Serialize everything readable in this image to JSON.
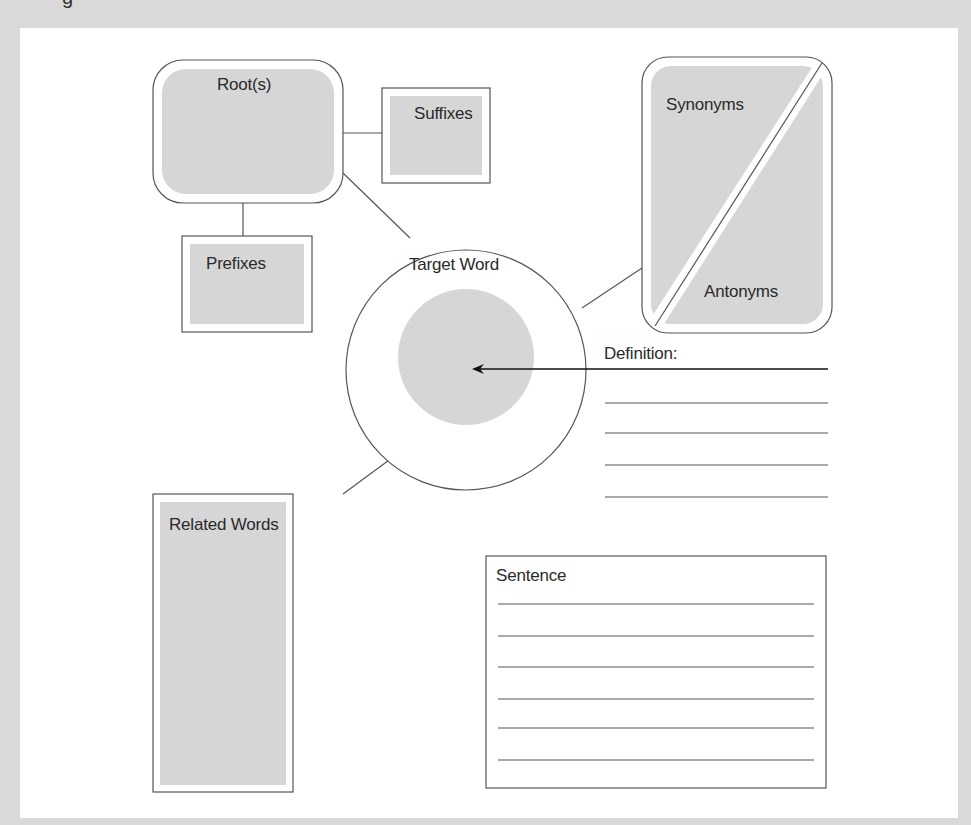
{
  "diagram": {
    "partial_header_glyph": "g",
    "nodes": {
      "roots": "Root(s)",
      "suffixes": "Suffixes",
      "prefixes": "Prefixes",
      "target_word": "Target Word",
      "synonyms": "Synonyms",
      "antonyms": "Antonyms",
      "definition": "Definition:",
      "related_words": "Related Words",
      "sentence": "Sentence"
    },
    "definition_line_count": 5,
    "sentence_line_count": 6,
    "colors": {
      "fill": "#d6d6d6",
      "stroke": "#555555",
      "background": "#ffffff",
      "frame": "#d9d9d9"
    }
  }
}
